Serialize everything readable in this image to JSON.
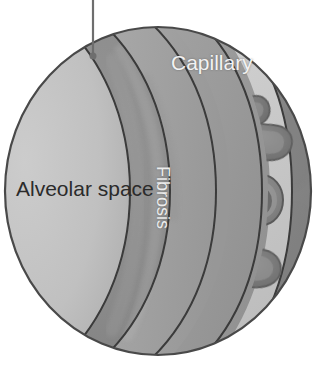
{
  "figure": {
    "type": "medical-illustration",
    "width": 321,
    "height": 371,
    "background_color": "#ffffff",
    "style": "grayscale"
  },
  "labels": {
    "alveolar_space": "Alveolar space",
    "capillary": "Capillary",
    "fibrosis": "Fibrosis"
  },
  "colors": {
    "background": "#ffffff",
    "alveolar_space": "#bdbdbd",
    "alveolar_wall": "#a3a3a3",
    "fibrosis_band": "#9a9a9a",
    "basement_membrane": "#c9c9c9",
    "capillary_lumen": "#8a8a8a",
    "outline": "#3a3a3a",
    "rbc_fill": "#7a7a7a",
    "rbc_core": "#6b6b6b",
    "rbc_rim": "#909090",
    "leader_line": "#6e6e6e",
    "label_dark": "#2b2b2b",
    "label_light": "#f2f2f2"
  },
  "geometry": {
    "sphere": {
      "center_x": 158,
      "center_y": 191,
      "radius_x": 153,
      "radius_y": 164
    },
    "leader": {
      "x": 93,
      "y_top": 0,
      "y_bottom": 56,
      "dot_radius": 3.5
    }
  },
  "structures": [
    {
      "name": "alveolar-space",
      "order": 1,
      "label": "Alveolar space",
      "tone": "light"
    },
    {
      "name": "alveolar-wall",
      "order": 2,
      "label": "",
      "tone": "medium"
    },
    {
      "name": "fibrosis-band",
      "order": 3,
      "label": "Fibrosis",
      "tone": "medium-dark"
    },
    {
      "name": "basement-membrane",
      "order": 4,
      "label": "",
      "tone": "bright"
    },
    {
      "name": "capillary-lumen",
      "order": 5,
      "label": "Capillary",
      "tone": "dark"
    }
  ],
  "red_blood_cells": [
    {
      "id": "rbc-1",
      "shape": "bean",
      "cx": 238,
      "cy": 111,
      "rx": 33,
      "ry": 20,
      "rotation": -18
    },
    {
      "id": "rbc-2",
      "shape": "bean",
      "cx": 262,
      "cy": 140,
      "rx": 32,
      "ry": 19,
      "rotation": 12
    },
    {
      "id": "rbc-3",
      "shape": "disc",
      "cx": 262,
      "cy": 200,
      "rx": 21,
      "ry": 25,
      "rotation": 0
    },
    {
      "id": "rbc-4",
      "shape": "bean",
      "cx": 253,
      "cy": 268,
      "rx": 31,
      "ry": 19,
      "rotation": 8
    }
  ]
}
